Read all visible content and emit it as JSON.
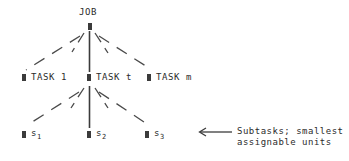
{
  "diagram": {
    "title_node": {
      "label": "JOB",
      "name": "job-root-node"
    },
    "tier_tasks": [
      {
        "label": "TASK 1",
        "name": "task-1-node"
      },
      {
        "label": "TASK t",
        "name": "task-t-node"
      },
      {
        "label": "TASK m",
        "name": "task-m-node"
      }
    ],
    "tier_subtasks": [
      {
        "base": "s",
        "sub": "1",
        "name": "subtask-s1-node"
      },
      {
        "base": "s",
        "sub": "2",
        "name": "subtask-s2-node"
      },
      {
        "base": "s",
        "sub": "3",
        "name": "subtask-s3-node"
      }
    ],
    "annotation": {
      "line1": "Subtasks; smallest",
      "line2": "assignable units",
      "arrow": "left-arrow"
    },
    "colors": {
      "ink": "#2b2b2b",
      "marker": "#3b3b3b",
      "edge": "#4a4a4a",
      "background": "#ffffff"
    }
  }
}
